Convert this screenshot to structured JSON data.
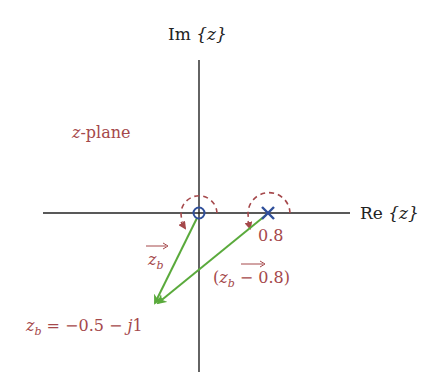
{
  "axes": {
    "imag_label": "Im {z}",
    "imag_label_prefix": "Im",
    "imag_label_var": "{z}",
    "real_label": "Re {z}",
    "real_label_prefix": "Re",
    "real_label_var": "{z}"
  },
  "plane_label": {
    "var": "z",
    "text": "-plane"
  },
  "zero": {
    "position": 0,
    "marker": "circle",
    "color": "#2f4f9a"
  },
  "pole": {
    "position": 0.8,
    "label": "0.8",
    "marker": "cross",
    "color": "#2f4f9a"
  },
  "vectors": [
    {
      "name": "zb",
      "label_var": "z",
      "label_sub": "b",
      "from": "0",
      "to": "-0.5-j1",
      "color": "#5aaa3c"
    },
    {
      "name": "zb-minus-0.8",
      "label_open": "(",
      "label_var": "z",
      "label_sub": "b",
      "label_rest": " − 0.8)",
      "from": "0.8",
      "to": "-0.5-j1",
      "color": "#5aaa3c"
    }
  ],
  "point": {
    "var": "z",
    "sub": "b",
    "equation": " = −0.5 − ",
    "j": "j",
    "tail": "1"
  },
  "colors": {
    "accent_red": "#a5484b",
    "marker_blue": "#2f4f9a",
    "vector_green": "#5aaa3c",
    "axis": "#222222"
  }
}
